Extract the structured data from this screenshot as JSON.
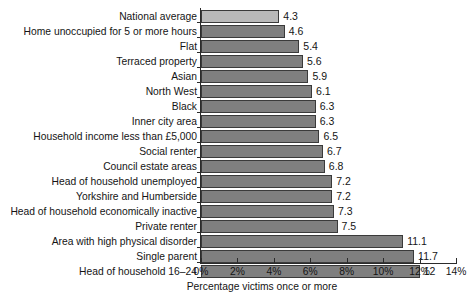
{
  "chart_data": {
    "type": "bar",
    "orientation": "horizontal",
    "title": "",
    "xlabel": "Percentage victims once or more",
    "ylabel": "",
    "xlim": [
      0,
      14
    ],
    "xticks": [
      "0%",
      "2%",
      "4%",
      "6%",
      "8%",
      "10%",
      "12%",
      "14%"
    ],
    "xtick_values": [
      0,
      2,
      4,
      6,
      8,
      10,
      12,
      14
    ],
    "grid": false,
    "legend": "none",
    "value_label_format": "one decimal, trailing .0 omitted",
    "categories": [
      "National average",
      "Home unoccupied for 5 or more hours",
      "Flat",
      "Terraced property",
      "Asian",
      "North West",
      "Black",
      "Inner city area",
      "Household income less than £5,000",
      "Social renter",
      "Council estate areas",
      "Head of household unemployed",
      "Yorkshire and Humberside",
      "Head of household economically inactive",
      "Private renter",
      "Area with high physical disorder",
      "Single parent",
      "Head of household 16–24"
    ],
    "values": [
      4.3,
      4.6,
      5.4,
      5.6,
      5.9,
      6.1,
      6.3,
      6.3,
      6.5,
      6.7,
      6.8,
      7.2,
      7.2,
      7.3,
      7.5,
      11.1,
      11.7,
      12
    ],
    "value_labels": [
      "4.3",
      "4.6",
      "5.4",
      "5.6",
      "5.9",
      "6.1",
      "6.3",
      "6.3",
      "6.5",
      "6.7",
      "6.8",
      "7.2",
      "7.2",
      "7.3",
      "7.5",
      "11.1",
      "11.7",
      "12"
    ],
    "highlight_index": 0,
    "colors": {
      "bar": "#7f7f7f",
      "bar_highlight": "#b9b9b9",
      "bar_border": "#3a3a3a",
      "axis": "#2b2b2b",
      "text": "#141414",
      "background": "#ffffff"
    }
  }
}
